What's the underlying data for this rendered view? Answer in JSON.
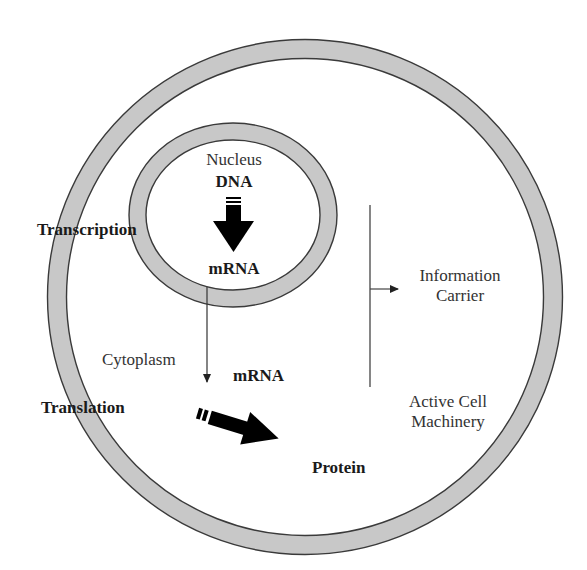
{
  "diagram": {
    "colors": {
      "membrane_fill": "#c8c8c8",
      "membrane_stroke": "#3a3a3a",
      "arrow": "#000000",
      "line": "#444444",
      "background": "#ffffff"
    },
    "cell": {
      "label": "Cytoplasm"
    },
    "nucleus": {
      "label": "Nucleus",
      "source": "DNA",
      "product": "mRNA"
    },
    "cytoplasm_mrna": "mRNA",
    "processes": {
      "transcription": "Transcription",
      "translation": "Translation"
    },
    "output": "Protein",
    "bracket": {
      "upper_line1": "Information",
      "upper_line2": "Carrier",
      "lower_line1": "Active Cell",
      "lower_line2": "Machinery"
    }
  }
}
